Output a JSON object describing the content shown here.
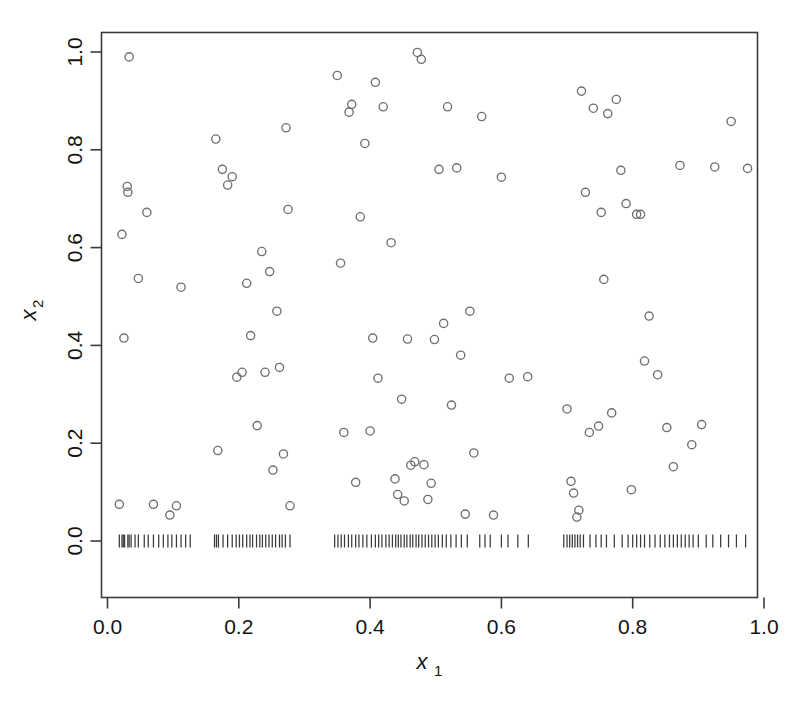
{
  "figure": {
    "background": "#ffffff",
    "point_color": "#6e6e73",
    "axis_color": "#3b3b3b",
    "rug_color": "#3a3a3a",
    "width": 789,
    "height": 703
  },
  "axes": {
    "x_title": "x",
    "x_title_sub": "1",
    "y_title": "x",
    "y_title_sub": "2",
    "x_ticks": [
      "0.0",
      "0.2",
      "0.4",
      "0.6",
      "0.8",
      "1.0"
    ],
    "y_ticks": [
      "0.0",
      "0.2",
      "0.4",
      "0.6",
      "0.8",
      "1.0"
    ]
  },
  "chart_data": {
    "type": "scatter",
    "title": "",
    "xlabel": "x1",
    "ylabel": "x2",
    "xlim": [
      -0.03,
      1.03
    ],
    "ylim": [
      -0.09,
      1.05
    ],
    "grid": false,
    "legend": null,
    "marker": "open-circle",
    "x_tick_values": [
      0.0,
      0.2,
      0.4,
      0.6,
      0.8,
      1.0
    ],
    "y_tick_values": [
      0.0,
      0.2,
      0.4,
      0.6,
      0.8,
      1.0
    ],
    "series": [
      {
        "name": "points",
        "marker": "open-circle",
        "points": [
          [
            0.025,
            0.415
          ],
          [
            0.022,
            0.627
          ],
          [
            0.018,
            0.075
          ],
          [
            0.033,
            0.99
          ],
          [
            0.03,
            0.725
          ],
          [
            0.031,
            0.713
          ],
          [
            0.047,
            0.537
          ],
          [
            0.06,
            0.672
          ],
          [
            0.07,
            0.075
          ],
          [
            0.095,
            0.053
          ],
          [
            0.105,
            0.072
          ],
          [
            0.112,
            0.519
          ],
          [
            0.165,
            0.822
          ],
          [
            0.168,
            0.185
          ],
          [
            0.175,
            0.76
          ],
          [
            0.183,
            0.728
          ],
          [
            0.19,
            0.745
          ],
          [
            0.197,
            0.335
          ],
          [
            0.205,
            0.345
          ],
          [
            0.212,
            0.527
          ],
          [
            0.218,
            0.42
          ],
          [
            0.228,
            0.236
          ],
          [
            0.235,
            0.592
          ],
          [
            0.24,
            0.345
          ],
          [
            0.247,
            0.551
          ],
          [
            0.252,
            0.145
          ],
          [
            0.258,
            0.47
          ],
          [
            0.262,
            0.355
          ],
          [
            0.268,
            0.178
          ],
          [
            0.272,
            0.845
          ],
          [
            0.275,
            0.678
          ],
          [
            0.278,
            0.072
          ],
          [
            0.35,
            0.952
          ],
          [
            0.355,
            0.568
          ],
          [
            0.36,
            0.222
          ],
          [
            0.368,
            0.877
          ],
          [
            0.372,
            0.893
          ],
          [
            0.378,
            0.12
          ],
          [
            0.385,
            0.663
          ],
          [
            0.392,
            0.813
          ],
          [
            0.4,
            0.225
          ],
          [
            0.404,
            0.415
          ],
          [
            0.408,
            0.938
          ],
          [
            0.412,
            0.333
          ],
          [
            0.42,
            0.888
          ],
          [
            0.432,
            0.61
          ],
          [
            0.438,
            0.127
          ],
          [
            0.442,
            0.095
          ],
          [
            0.448,
            0.29
          ],
          [
            0.452,
            0.082
          ],
          [
            0.457,
            0.413
          ],
          [
            0.462,
            0.155
          ],
          [
            0.468,
            0.162
          ],
          [
            0.472,
            0.999
          ],
          [
            0.478,
            0.985
          ],
          [
            0.482,
            0.156
          ],
          [
            0.488,
            0.085
          ],
          [
            0.493,
            0.118
          ],
          [
            0.498,
            0.412
          ],
          [
            0.505,
            0.76
          ],
          [
            0.512,
            0.445
          ],
          [
            0.518,
            0.888
          ],
          [
            0.524,
            0.278
          ],
          [
            0.532,
            0.763
          ],
          [
            0.538,
            0.38
          ],
          [
            0.545,
            0.055
          ],
          [
            0.552,
            0.47
          ],
          [
            0.558,
            0.18
          ],
          [
            0.57,
            0.868
          ],
          [
            0.588,
            0.053
          ],
          [
            0.6,
            0.744
          ],
          [
            0.612,
            0.333
          ],
          [
            0.64,
            0.336
          ],
          [
            0.7,
            0.27
          ],
          [
            0.706,
            0.122
          ],
          [
            0.71,
            0.098
          ],
          [
            0.715,
            0.049
          ],
          [
            0.718,
            0.063
          ],
          [
            0.722,
            0.92
          ],
          [
            0.728,
            0.713
          ],
          [
            0.734,
            0.222
          ],
          [
            0.74,
            0.885
          ],
          [
            0.748,
            0.235
          ],
          [
            0.752,
            0.672
          ],
          [
            0.756,
            0.535
          ],
          [
            0.762,
            0.874
          ],
          [
            0.768,
            0.262
          ],
          [
            0.775,
            0.903
          ],
          [
            0.782,
            0.758
          ],
          [
            0.79,
            0.69
          ],
          [
            0.798,
            0.105
          ],
          [
            0.806,
            0.668
          ],
          [
            0.812,
            0.668
          ],
          [
            0.818,
            0.368
          ],
          [
            0.825,
            0.46
          ],
          [
            0.838,
            0.34
          ],
          [
            0.852,
            0.232
          ],
          [
            0.862,
            0.152
          ],
          [
            0.872,
            0.768
          ],
          [
            0.89,
            0.197
          ],
          [
            0.905,
            0.238
          ],
          [
            0.925,
            0.765
          ],
          [
            0.95,
            0.858
          ],
          [
            0.975,
            0.762
          ]
        ]
      }
    ],
    "rug": {
      "axis": "x",
      "y_value": 0.0,
      "values": [
        0.018,
        0.022,
        0.024,
        0.026,
        0.031,
        0.033,
        0.036,
        0.042,
        0.047,
        0.056,
        0.062,
        0.07,
        0.078,
        0.085,
        0.092,
        0.098,
        0.105,
        0.112,
        0.119,
        0.126,
        0.163,
        0.166,
        0.169,
        0.176,
        0.183,
        0.19,
        0.196,
        0.201,
        0.206,
        0.212,
        0.217,
        0.221,
        0.227,
        0.232,
        0.236,
        0.241,
        0.246,
        0.251,
        0.256,
        0.262,
        0.266,
        0.271,
        0.278,
        0.346,
        0.351,
        0.356,
        0.361,
        0.367,
        0.372,
        0.378,
        0.383,
        0.389,
        0.395,
        0.402,
        0.408,
        0.413,
        0.418,
        0.424,
        0.429,
        0.434,
        0.439,
        0.443,
        0.447,
        0.452,
        0.456,
        0.461,
        0.465,
        0.47,
        0.474,
        0.479,
        0.484,
        0.489,
        0.494,
        0.499,
        0.504,
        0.51,
        0.516,
        0.523,
        0.531,
        0.539,
        0.548,
        0.567,
        0.575,
        0.583,
        0.6,
        0.61,
        0.625,
        0.641,
        0.695,
        0.7,
        0.704,
        0.708,
        0.712,
        0.716,
        0.72,
        0.725,
        0.735,
        0.744,
        0.752,
        0.76,
        0.772,
        0.784,
        0.793,
        0.8,
        0.806,
        0.812,
        0.818,
        0.826,
        0.834,
        0.842,
        0.849,
        0.856,
        0.862,
        0.868,
        0.874,
        0.88,
        0.886,
        0.892,
        0.9,
        0.912,
        0.922,
        0.934,
        0.946,
        0.958,
        0.972
      ]
    }
  }
}
